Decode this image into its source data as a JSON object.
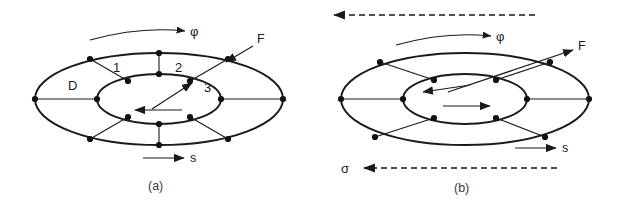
{
  "figure": {
    "background_color": "#ffffff",
    "stroke_color": "#1a1a1a",
    "vertex_color": "#111111",
    "caption_color": "#3a3a3a"
  },
  "panel_a": {
    "caption": "(a)",
    "labels": {
      "phi": "φ",
      "force": "F",
      "s": "s",
      "domain": "D",
      "region1": "1",
      "region2": "2",
      "region3": "3"
    },
    "geometry": {
      "outer_cx": 159,
      "outer_cy": 99,
      "outer_rx": 124,
      "outer_ry": 46,
      "inner_cx": 159,
      "inner_cy": 99,
      "inner_rx": 62,
      "inner_ry": 25
    },
    "arrows": [
      {
        "name": "phi-arc-arrow",
        "kind": "curved",
        "direction": "right",
        "dashed": false
      },
      {
        "name": "force-arrow",
        "kind": "straight",
        "direction": "down-left",
        "dashed": false
      },
      {
        "name": "inner-force-arrow",
        "kind": "straight",
        "direction": "up-right",
        "dashed": false
      },
      {
        "name": "inner-velocity-arrow",
        "kind": "straight",
        "direction": "left",
        "dashed": false
      },
      {
        "name": "s-arrow",
        "kind": "straight",
        "direction": "right",
        "dashed": false
      }
    ],
    "vertex_count": 16,
    "has_vertical_spokes": true
  },
  "panel_b": {
    "caption": "(b)",
    "labels": {
      "phi": "φ",
      "force": "F",
      "s": "s",
      "sigma": "σ"
    },
    "geometry": {
      "outer_cx": 465,
      "outer_cy": 99,
      "outer_rx": 124,
      "outer_ry": 46,
      "inner_cx": 465,
      "inner_cy": 99,
      "inner_rx": 62,
      "inner_ry": 25
    },
    "arrows": [
      {
        "name": "top-dashed-arrow",
        "kind": "straight",
        "direction": "left",
        "dashed": true
      },
      {
        "name": "phi-arc-arrow",
        "kind": "curved",
        "direction": "right",
        "dashed": false
      },
      {
        "name": "force-arrow",
        "kind": "straight",
        "direction": "up-right",
        "dashed": false
      },
      {
        "name": "inner-force-arrow",
        "kind": "straight",
        "direction": "down-left",
        "dashed": false
      },
      {
        "name": "inner-velocity-arrow",
        "kind": "straight",
        "direction": "right",
        "dashed": false
      },
      {
        "name": "s-arrow",
        "kind": "straight",
        "direction": "right",
        "dashed": false
      },
      {
        "name": "sigma-dashed-arrow",
        "kind": "straight",
        "direction": "left",
        "dashed": true
      }
    ],
    "vertex_count": 12,
    "has_vertical_spokes": false
  }
}
